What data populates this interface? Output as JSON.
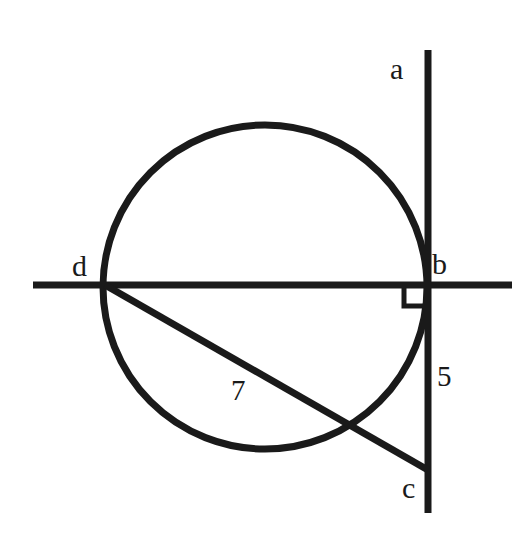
{
  "figure": {
    "kind": "circle-geometry-diagram",
    "background_color": "#ffffff",
    "stroke_color": "#1a1a1a",
    "width": 525,
    "height": 543
  },
  "labels": {
    "point_a": "a",
    "point_b": "b",
    "point_c": "c",
    "point_d": "d",
    "segment_bc_length": "5",
    "segment_dc_length": "7"
  },
  "geometry": {
    "circle": {
      "cx": 265,
      "cy": 287,
      "r": 162,
      "stroke_width": 7
    },
    "vertical_line": {
      "x": 428,
      "y1": 50,
      "y2": 513,
      "stroke_width": 7,
      "through_points": [
        "a",
        "b",
        "c"
      ]
    },
    "horizontal_line": {
      "y": 285,
      "x1": 33,
      "x2": 512,
      "stroke_width": 7,
      "through_points": [
        "d",
        "b"
      ]
    },
    "diagonal_line": {
      "x1": 105,
      "y1": 285,
      "x2": 428,
      "y2": 470,
      "stroke_width": 7,
      "through_points": [
        "d",
        "c"
      ]
    },
    "right_angle_marker": {
      "x": 404,
      "y": 285,
      "size": 21,
      "stroke_width": 5,
      "at_point": "b"
    },
    "points": {
      "a": {
        "x": 428,
        "y": 70
      },
      "b": {
        "x": 428,
        "y": 285
      },
      "c": {
        "x": 428,
        "y": 470
      },
      "d": {
        "x": 105,
        "y": 285
      }
    }
  }
}
